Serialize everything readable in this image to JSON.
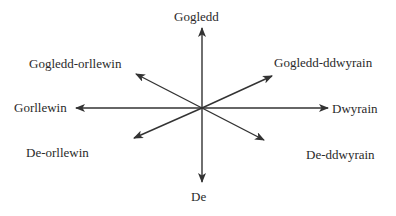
{
  "diagram": {
    "type": "compass-rose",
    "center": {
      "x": 202,
      "y": 108
    },
    "line_color": "#333333",
    "directions": [
      {
        "id": "n",
        "label": "Gogledd",
        "tip": {
          "x": 202,
          "y": 28
        }
      },
      {
        "id": "ne",
        "label": "Gogledd-ddwyrain",
        "tip": {
          "x": 272,
          "y": 76
        }
      },
      {
        "id": "e",
        "label": "Dwyrain",
        "tip": {
          "x": 328,
          "y": 108
        }
      },
      {
        "id": "se",
        "label": "De-ddwyrain",
        "tip": {
          "x": 264,
          "y": 140
        }
      },
      {
        "id": "s",
        "label": "De",
        "tip": {
          "x": 202,
          "y": 182
        }
      },
      {
        "id": "sw",
        "label": "De-orllewin",
        "tip": {
          "x": 134,
          "y": 138
        }
      },
      {
        "id": "w",
        "label": "Gorllewin",
        "tip": {
          "x": 76,
          "y": 108
        }
      },
      {
        "id": "nw",
        "label": "Gogledd-orllewin",
        "tip": {
          "x": 136,
          "y": 74
        }
      }
    ]
  }
}
